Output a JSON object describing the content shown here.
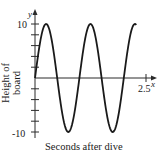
{
  "chart_data": {
    "type": "line",
    "title": "",
    "xlabel": "Seconds after dive",
    "ylabel": "Height of board",
    "x_axis_symbol": "x",
    "y_axis_symbol": "y",
    "xlim": [
      0,
      2.5
    ],
    "ylim": [
      -10,
      10
    ],
    "x_tick_labels": [
      "2.5"
    ],
    "y_tick_labels": [
      "10",
      "-10"
    ],
    "y_ticks": [
      10,
      8,
      6,
      4,
      2,
      0,
      -2,
      -4,
      -6,
      -8,
      -10
    ],
    "grid": false,
    "legend": null,
    "series": [
      {
        "name": "height",
        "function": "y = 10 sin(2πx)",
        "x": [
          0,
          0.25,
          0.5,
          0.75,
          1.0,
          1.25,
          1.5,
          1.75,
          2.0,
          2.25
        ],
        "y": [
          0,
          10,
          0,
          -10,
          0,
          10,
          0,
          -10,
          0,
          10
        ]
      }
    ],
    "color": "#1a1a1a"
  }
}
